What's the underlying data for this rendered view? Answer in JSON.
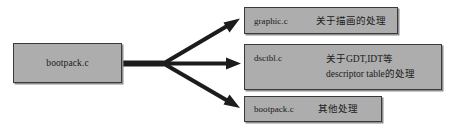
{
  "diagram": {
    "source": {
      "label": "bootpack.c"
    },
    "targets": [
      {
        "id": "graphic",
        "file": "graphic.c",
        "description_lines": [
          "关于描画的处理"
        ]
      },
      {
        "id": "dsctbl",
        "file": "dsctbl.c",
        "description_lines": [
          "关于GDT,IDT等",
          "descriptor table的处理"
        ]
      },
      {
        "id": "bootpack",
        "file": "bootpack.c",
        "description_lines": [
          "其他处理"
        ]
      }
    ],
    "colors": {
      "box_fill": "#adadad",
      "box_border": "#3a3a3a",
      "arrow": "#1c1c1c",
      "background": "#ffffff",
      "text": "#1a1a1a"
    }
  }
}
